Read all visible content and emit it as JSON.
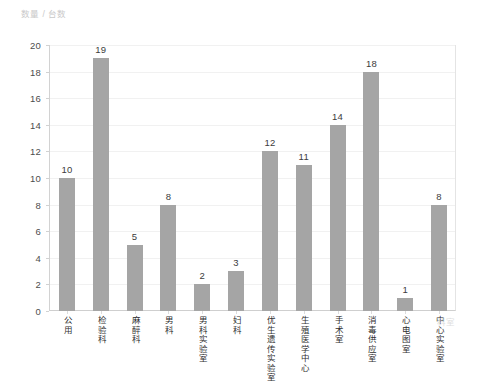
{
  "chart_data": {
    "type": "bar",
    "title": "",
    "ylabel": "数量 / 台数",
    "xlabel": "科室",
    "ylim": [
      0,
      20
    ],
    "ytick_step": 2,
    "yticks": [
      0,
      2,
      4,
      6,
      8,
      10,
      12,
      14,
      16,
      18,
      20
    ],
    "grid": true,
    "grid_axis": "y",
    "legend": false,
    "bar_color": "#a5a5a5",
    "value_labels": true,
    "categories": [
      "公用",
      "检验科",
      "麻醉科",
      "男科",
      "男科实验室",
      "妇科",
      "优生遗传实验室",
      "生殖医学中心",
      "手术室",
      "消毒供应室",
      "心电图室",
      "中心实验室"
    ],
    "values": [
      10,
      19,
      5,
      8,
      2,
      3,
      12,
      11,
      14,
      18,
      1,
      8
    ]
  },
  "colors": {
    "bar": "#a5a5a5",
    "gridline": "#f1f1f1",
    "axis": "#cfcfcf",
    "tick_text": "#4d4d4d",
    "value_text": "#3c3c3c",
    "axis_title": "#c9c9c9",
    "background": "#ffffff"
  }
}
